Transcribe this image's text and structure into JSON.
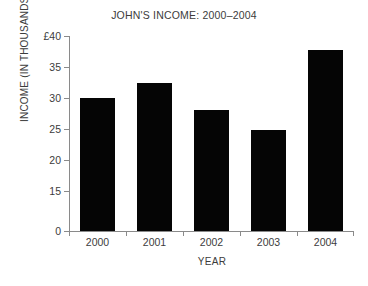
{
  "chart_data": {
    "type": "bar",
    "title": "JOHN'S INCOME: 2000–2004",
    "xlabel": "YEAR",
    "ylabel": "INCOME (IN THOUSANDS)",
    "categories": [
      "2000",
      "2001",
      "2002",
      "2003",
      "2004"
    ],
    "values": [
      30,
      32.5,
      28,
      24.8,
      37.8
    ],
    "currency_symbol": "£",
    "ytick_labels": [
      "£40",
      "35",
      "30",
      "25",
      "20",
      "15",
      "0"
    ],
    "ytick_values": [
      40,
      35,
      30,
      25,
      20,
      15,
      0
    ],
    "ylim": [
      0,
      40
    ],
    "axis_note": "y-axis compressed between 0 and 15 (broken axis)",
    "grid": false,
    "legend": false,
    "bar_color": "#050505",
    "axis_color": "#8a8a8a",
    "text_color": "#3c3c3c",
    "background_color": "#ffffff"
  }
}
